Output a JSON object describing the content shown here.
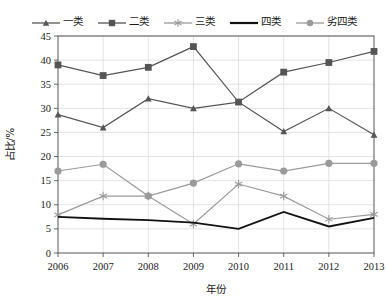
{
  "chart_data": {
    "type": "line",
    "title": "",
    "xlabel": "年份",
    "ylabel": "占比/%",
    "categories": [
      "2006",
      "2007",
      "2008",
      "2009",
      "2010",
      "2011",
      "2012",
      "2013"
    ],
    "x": [
      2006,
      2007,
      2008,
      2009,
      2010,
      2011,
      2012,
      2013
    ],
    "xlim": [
      2006,
      2013
    ],
    "ylim": [
      0,
      45
    ],
    "yticks": [
      0,
      5,
      10,
      15,
      20,
      25,
      30,
      35,
      40,
      45
    ],
    "grid": true,
    "legend_position": "top",
    "series": [
      {
        "name": "一类",
        "marker": "triangle",
        "color": "#555555",
        "values": [
          28.7,
          26.0,
          32.0,
          30.0,
          31.3,
          25.2,
          30.0,
          24.5
        ]
      },
      {
        "name": "二类",
        "marker": "square",
        "color": "#555555",
        "values": [
          39.0,
          36.8,
          38.5,
          42.8,
          31.3,
          37.5,
          39.5,
          41.8
        ]
      },
      {
        "name": "三类",
        "marker": "asterisk",
        "color": "#9a9a9a",
        "values": [
          7.9,
          11.8,
          11.8,
          6.0,
          14.3,
          11.8,
          7.0,
          8.0
        ]
      },
      {
        "name": "四类",
        "marker": "none",
        "color": "#111111",
        "values": [
          7.5,
          7.1,
          6.8,
          6.3,
          5.0,
          8.5,
          5.5,
          7.3
        ]
      },
      {
        "name": "劣四类",
        "marker": "circle",
        "color": "#9a9a9a",
        "values": [
          17.0,
          18.4,
          11.8,
          14.5,
          18.5,
          17.0,
          18.6,
          18.6
        ]
      }
    ]
  },
  "legend": {
    "items": [
      {
        "label": "一类",
        "icon": "triangle-marker-icon"
      },
      {
        "label": "二类",
        "icon": "square-marker-icon"
      },
      {
        "label": "三类",
        "icon": "asterisk-marker-icon"
      },
      {
        "label": "四类",
        "icon": "plain-line-icon"
      },
      {
        "label": "劣四类",
        "icon": "circle-marker-icon"
      }
    ]
  },
  "axes": {
    "y_title": "占比/%",
    "x_title": "年份",
    "y_tick_labels": [
      "45",
      "40",
      "35",
      "30",
      "25",
      "20",
      "15",
      "10",
      "5",
      "0"
    ],
    "x_tick_labels": [
      "2006",
      "2007",
      "2008",
      "2009",
      "2010",
      "2011",
      "2012",
      "2013"
    ]
  }
}
